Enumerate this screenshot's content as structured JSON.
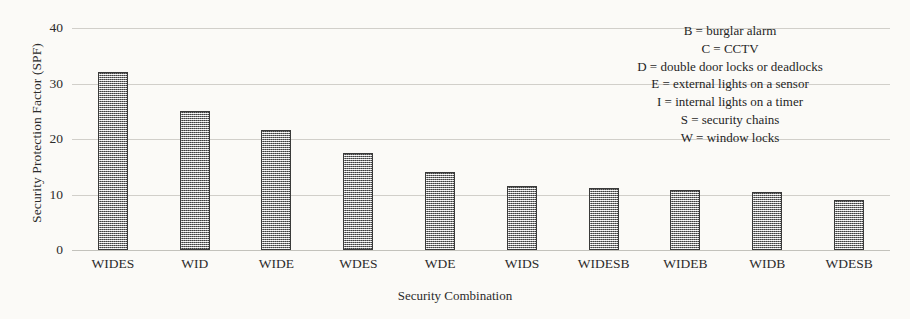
{
  "chart_data": {
    "type": "bar",
    "title": "",
    "xlabel": "Security Combination",
    "ylabel": "Security Protection Factor (SPF)",
    "categories": [
      "WIDES",
      "WID",
      "WIDE",
      "WDES",
      "WDE",
      "WIDS",
      "WIDESB",
      "WIDEB",
      "WIDB",
      "WDESB"
    ],
    "values": [
      32.0,
      25.0,
      21.7,
      17.4,
      14.0,
      11.5,
      11.2,
      10.8,
      10.4,
      9.0
    ],
    "ylim": [
      0,
      40
    ],
    "yticks": [
      0,
      10,
      20,
      30,
      40
    ],
    "ytick_labels": [
      "0",
      "10",
      "20",
      "30",
      "40"
    ],
    "grid": "horizontal",
    "legend_position": "top-right-inside",
    "bar_fill": "#8d8d8d",
    "bar_border": "#3a3a3a",
    "gridline_color": "#c9c7c2",
    "background": "#fbfaf7",
    "annotations": [
      "B =  burglar alarm",
      "C = CCTV",
      "D = double door locks or deadlocks",
      "E = external lights on a sensor",
      "I = internal lights on a timer",
      "S = security chains",
      "W = window locks"
    ]
  },
  "legend": {
    "lines": [
      {
        "text": "B =  burglar alarm"
      },
      {
        "text": "C = CCTV"
      },
      {
        "text": "D = double door locks or deadlocks"
      },
      {
        "text": "E = external lights on a sensor"
      },
      {
        "text": "I = internal lights on a timer"
      },
      {
        "text": "S = security chains"
      },
      {
        "text": "W = window locks"
      }
    ]
  }
}
